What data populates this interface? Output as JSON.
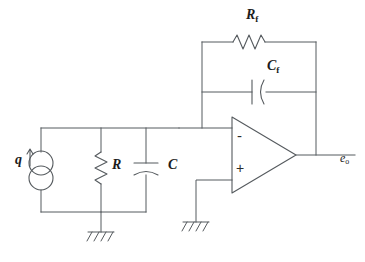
{
  "diagram": {
    "type": "electronic-schematic",
    "line_color": "#555a5e",
    "text_color": "#1c1c1c",
    "background": "#ffffff"
  },
  "labels": {
    "feedback_resistor": {
      "symbol": "R",
      "subscript": "f",
      "name": "R_f"
    },
    "feedback_capacitor": {
      "symbol": "C",
      "subscript": "f",
      "name": "C_f"
    },
    "source_resistor": {
      "symbol": "R",
      "subscript": "",
      "name": "R"
    },
    "source_capacitor": {
      "symbol": "C",
      "subscript": "",
      "name": "C"
    },
    "charge_source": {
      "symbol": "q",
      "subscript": "",
      "name": "q"
    },
    "output_voltage": {
      "symbol": "e",
      "subscript": "o",
      "name": "e_o"
    },
    "inverting_input": "-",
    "noninverting_input": "+"
  },
  "components": [
    {
      "id": "current-source",
      "kind": "current-source",
      "label": "q",
      "orientation": "vertical",
      "arrow": "up"
    },
    {
      "id": "resistor-R",
      "kind": "resistor",
      "label": "R",
      "orientation": "vertical"
    },
    {
      "id": "capacitor-C",
      "kind": "capacitor",
      "label": "C",
      "orientation": "vertical",
      "style": "curved-plate"
    },
    {
      "id": "resistor-Rf",
      "kind": "resistor",
      "label": "R_f",
      "orientation": "horizontal"
    },
    {
      "id": "capacitor-Cf",
      "kind": "capacitor",
      "label": "C_f",
      "orientation": "horizontal",
      "style": "curved-plate"
    },
    {
      "id": "op-amp",
      "kind": "operational-amplifier",
      "inputs": [
        "-",
        "+"
      ],
      "output": "e_o"
    },
    {
      "id": "ground-input",
      "kind": "ground"
    },
    {
      "id": "ground-noninverting",
      "kind": "ground"
    }
  ]
}
